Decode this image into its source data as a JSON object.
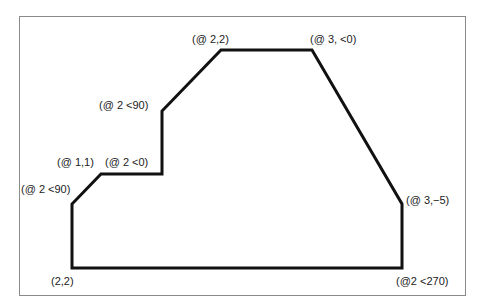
{
  "diagram": {
    "type": "polyline-coordinate-entry",
    "stroke_color": "#111111",
    "frame_color": "#8a8a8a",
    "vertices": [
      {
        "x": 72,
        "y": 268
      },
      {
        "x": 72,
        "y": 204
      },
      {
        "x": 101,
        "y": 174
      },
      {
        "x": 162,
        "y": 174
      },
      {
        "x": 162,
        "y": 111
      },
      {
        "x": 221,
        "y": 50
      },
      {
        "x": 312,
        "y": 50
      },
      {
        "x": 402,
        "y": 204
      },
      {
        "x": 402,
        "y": 268
      }
    ],
    "labels": [
      {
        "text": "(2,2)",
        "x": 51,
        "y": 275
      },
      {
        "text": "(@ 2 <90)",
        "x": 21,
        "y": 183
      },
      {
        "text": "(@ 1,1)",
        "x": 57,
        "y": 156
      },
      {
        "text": "(@ 2 <0)",
        "x": 105,
        "y": 156
      },
      {
        "text": "(@ 2 <90)",
        "x": 99,
        "y": 99
      },
      {
        "text": "(@ 2,2)",
        "x": 192,
        "y": 33
      },
      {
        "text": "(@ 3, <0)",
        "x": 310,
        "y": 33
      },
      {
        "text": "(@ 3,−5)",
        "x": 406,
        "y": 194
      },
      {
        "text": "(@2 <270)",
        "x": 396,
        "y": 275
      }
    ]
  }
}
